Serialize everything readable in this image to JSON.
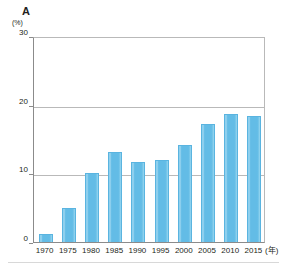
{
  "panel": {
    "title": "A"
  },
  "chart_data": {
    "type": "bar",
    "title": "A",
    "xlabel": "(年)",
    "ylabel": "(%)",
    "categories": [
      "1970",
      "1975",
      "1980",
      "1985",
      "1990",
      "1995",
      "2000",
      "2005",
      "2010",
      "2015"
    ],
    "values": [
      1.2,
      4.9,
      10.1,
      13.1,
      11.7,
      12.0,
      14.2,
      17.2,
      18.6,
      18.3
    ],
    "ylim": [
      0,
      30
    ],
    "yticks": [
      0,
      10,
      20,
      30
    ],
    "ytick_labels": [
      "0",
      "10",
      "20",
      "30"
    ],
    "y_unit": "(%)",
    "x_unit": "(年)",
    "grid": true,
    "gridlines_at": [
      10,
      20
    ],
    "legend": "none",
    "series_color": "#63bce6"
  },
  "colors": {
    "bar": "#63bce6",
    "bar_edge": "#5ab4e0",
    "axis": "#8b8b8b",
    "grid": "#b9b9b9",
    "text": "#231f20"
  }
}
